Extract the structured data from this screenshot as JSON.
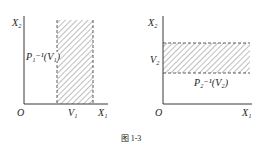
{
  "figure": {
    "caption": "图 1-3",
    "left": {
      "y_axis_label": "X₂",
      "x_axis_label": "X₁",
      "origin_label": "O",
      "x_tick_label": "V₁",
      "region_label": "P₁⁻¹(V₁)",
      "region_type": "vertical strip (hatched)"
    },
    "right": {
      "y_axis_label": "X₂",
      "x_axis_label": "X₁",
      "origin_label": "O",
      "y_tick_label": "V₂",
      "region_label": "P₂⁻¹(V₂)",
      "region_type": "horizontal strip (hatched)"
    }
  }
}
